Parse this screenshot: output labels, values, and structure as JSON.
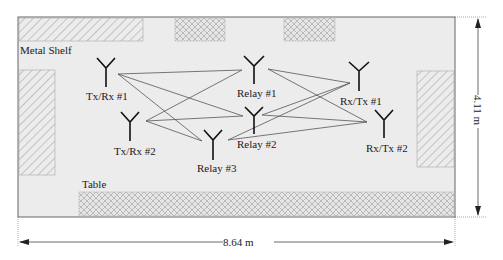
{
  "diagram": {
    "room": {
      "width_label": "8.64 m",
      "height_label": "4.11 m",
      "fill": "#ececec",
      "border": "#666666"
    },
    "obstacles": [
      {
        "id": "metal-shelf-top-left",
        "label": "Metal Shelf",
        "pattern": "diagonal"
      },
      {
        "id": "metal-shelf-left",
        "label": "",
        "pattern": "diagonal"
      },
      {
        "id": "metal-shelf-right",
        "label": "",
        "pattern": "diagonal"
      },
      {
        "id": "crosshatch-top-1",
        "label": "",
        "pattern": "crosshatch"
      },
      {
        "id": "crosshatch-top-2",
        "label": "",
        "pattern": "crosshatch"
      },
      {
        "id": "table",
        "label": "Table",
        "pattern": "crosshatch"
      }
    ],
    "labels": {
      "metal_shelf": "Metal Shelf",
      "table": "Table"
    },
    "nodes": [
      {
        "id": "txrx1",
        "label": "Tx/Rx #1"
      },
      {
        "id": "txrx2",
        "label": "Tx/Rx #2"
      },
      {
        "id": "relay1",
        "label": "Relay #1"
      },
      {
        "id": "relay2",
        "label": "Relay #2"
      },
      {
        "id": "relay3",
        "label": "Relay #3"
      },
      {
        "id": "rxtx1",
        "label": "Rx/Tx #1"
      },
      {
        "id": "rxtx2",
        "label": "Rx/Tx #2"
      }
    ],
    "links": [
      [
        "txrx1",
        "relay1"
      ],
      [
        "txrx1",
        "relay2"
      ],
      [
        "txrx1",
        "relay3"
      ],
      [
        "txrx2",
        "relay1"
      ],
      [
        "txrx2",
        "relay2"
      ],
      [
        "txrx2",
        "relay3"
      ],
      [
        "relay1",
        "rxtx1"
      ],
      [
        "relay1",
        "rxtx2"
      ],
      [
        "relay2",
        "rxtx1"
      ],
      [
        "relay2",
        "rxtx2"
      ],
      [
        "relay3",
        "rxtx1"
      ],
      [
        "relay3",
        "rxtx2"
      ]
    ],
    "link_color": "#555555"
  }
}
